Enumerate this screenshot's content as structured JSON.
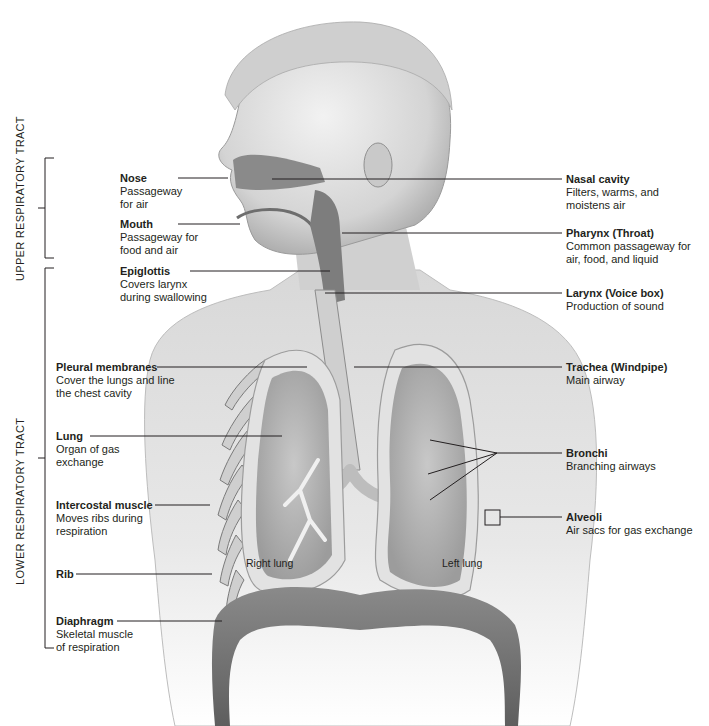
{
  "regions": {
    "upper": "UPPER RESPIRATORY TRACT",
    "lower": "LOWER RESPIRATORY TRACT"
  },
  "left_labels": [
    {
      "title": "Nose",
      "desc": [
        "Passageway",
        "for air"
      ]
    },
    {
      "title": "Mouth",
      "desc": [
        "Passageway for",
        "food and air"
      ]
    },
    {
      "title": "Epiglottis",
      "desc": [
        "Covers larynx",
        "during swallowing"
      ]
    },
    {
      "title": "Pleural membranes",
      "desc": [
        "Cover the lungs and line",
        "the chest cavity"
      ]
    },
    {
      "title": "Lung",
      "desc": [
        "Organ of gas",
        "exchange"
      ]
    },
    {
      "title": "Intercostal muscle",
      "desc": [
        "Moves ribs during",
        "respiration"
      ]
    },
    {
      "title": "Rib",
      "desc": []
    },
    {
      "title": "Diaphragm",
      "desc": [
        "Skeletal muscle",
        "of respiration"
      ]
    }
  ],
  "right_labels": [
    {
      "title": "Nasal cavity",
      "desc": [
        "Filters, warms, and",
        "moistens air"
      ]
    },
    {
      "title": "Pharynx (Throat)",
      "desc": [
        "Common passageway for",
        "air, food, and liquid"
      ]
    },
    {
      "title": "Larynx (Voice box)",
      "desc": [
        "Production of sound"
      ]
    },
    {
      "title": "Trachea (Windpipe)",
      "desc": [
        "Main airway"
      ]
    },
    {
      "title": "Bronchi",
      "desc": [
        "Branching airways"
      ]
    },
    {
      "title": "Alveoli",
      "desc": [
        "Air sacs for gas exchange"
      ]
    }
  ],
  "organ_labels": {
    "right_lung": "Right lung",
    "left_lung": "Left lung"
  },
  "colors": {
    "skin": "#d9d9d9",
    "skin_shadow": "#b5b5b5",
    "airway": "#7d7d7d",
    "lung_inner": "#a9a9a9",
    "muscle": "#6f6f6f",
    "line": "#231f20"
  }
}
